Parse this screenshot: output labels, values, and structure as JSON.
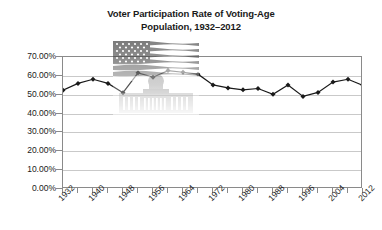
{
  "chart_data": {
    "type": "line",
    "title": "Voter Participation Rate of Voting-Age Population, 1932–2012",
    "title_lines": [
      "Voter Participation Rate of Voting-Age",
      "Population, 1932–2012"
    ],
    "xlabel": "",
    "ylabel": "",
    "ylim": [
      0,
      70
    ],
    "xlim": [
      1932,
      2012
    ],
    "grid": true,
    "legend": false,
    "legend_position": "none",
    "y_tick_labels": [
      "70.00%",
      "60.00%",
      "50.00%",
      "40.00%",
      "30.00%",
      "20.00%",
      "10.00%",
      "0.00%"
    ],
    "y_tick_values": [
      70,
      60,
      50,
      40,
      30,
      20,
      10,
      0
    ],
    "x_tick_labels": [
      "1932",
      "1940",
      "1948",
      "1956",
      "1964",
      "1972",
      "1980",
      "1988",
      "1996",
      "2004",
      "2012"
    ],
    "x_tick_values": [
      1932,
      1940,
      1948,
      1956,
      1964,
      1972,
      1980,
      1988,
      1996,
      2004,
      2012
    ],
    "categories": [
      1932,
      1936,
      1940,
      1944,
      1948,
      1952,
      1956,
      1960,
      1964,
      1968,
      1972,
      1976,
      1980,
      1984,
      1988,
      1992,
      1996,
      2000,
      2004,
      2008,
      2012
    ],
    "values": [
      52.4,
      56.0,
      58.2,
      56.0,
      51.1,
      61.6,
      59.3,
      62.8,
      61.9,
      60.9,
      55.2,
      53.6,
      52.6,
      53.3,
      50.2,
      55.2,
      49.1,
      51.2,
      56.7,
      58.2,
      54.9
    ],
    "series": [
      {
        "name": "Voter participation rate",
        "marker": "diamond",
        "color": "#1a1a1a",
        "values": [
          52.4,
          56.0,
          58.2,
          56.0,
          51.1,
          61.6,
          59.3,
          62.8,
          61.9,
          60.9,
          55.2,
          53.6,
          52.6,
          53.3,
          50.2,
          55.2,
          49.1,
          51.2,
          56.7,
          58.2,
          54.9
        ]
      }
    ],
    "annotations": [
      {
        "name": "us-flag-capitol-watermark",
        "description": "Faded United States flag over the Capitol building, watermark behind the plot"
      }
    ]
  },
  "colors": {
    "series_line": "#1a1a1a",
    "marker": "#1a1a1a",
    "gridline": "#c9c9c9",
    "axis": "#8a8a8a",
    "text": "#1a1a1a",
    "background": "#ffffff"
  }
}
